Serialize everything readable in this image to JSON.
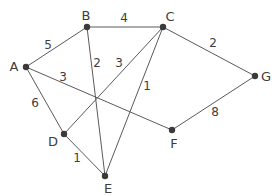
{
  "graph": {
    "type": "weighted-undirected-graph",
    "node_color": "#3a3a3a",
    "edge_color": "#5a5a5a",
    "nodes": [
      {
        "id": "A",
        "label": "A",
        "x": 26,
        "y": 67,
        "lx": 14,
        "ly": 66
      },
      {
        "id": "B",
        "label": "B",
        "x": 87,
        "y": 27,
        "lx": 86,
        "ly": 15
      },
      {
        "id": "C",
        "label": "C",
        "x": 163,
        "y": 27,
        "lx": 170,
        "ly": 16
      },
      {
        "id": "G",
        "label": "G",
        "x": 255,
        "y": 76,
        "lx": 266,
        "ly": 76
      },
      {
        "id": "F",
        "label": "F",
        "x": 172,
        "y": 130,
        "lx": 174,
        "ly": 143
      },
      {
        "id": "D",
        "label": "D",
        "x": 64,
        "y": 134,
        "lx": 53,
        "ly": 141
      },
      {
        "id": "E",
        "label": "E",
        "x": 105,
        "y": 176,
        "lx": 108,
        "ly": 188
      }
    ],
    "edges": [
      {
        "from": "A",
        "to": "B",
        "weight": "5",
        "wx": 48,
        "wy": 45
      },
      {
        "from": "B",
        "to": "C",
        "weight": "4",
        "wx": 124,
        "wy": 18
      },
      {
        "from": "C",
        "to": "G",
        "weight": "2",
        "wx": 213,
        "wy": 43
      },
      {
        "from": "A",
        "to": "D",
        "weight": "6",
        "wx": 35,
        "wy": 103
      },
      {
        "from": "A",
        "to": "F",
        "weight": "3",
        "wx": 63,
        "wy": 77
      },
      {
        "from": "B",
        "to": "E",
        "weight": "2",
        "wx": 97,
        "wy": 63
      },
      {
        "from": "C",
        "to": "D",
        "weight": "3",
        "wx": 119,
        "wy": 63
      },
      {
        "from": "C",
        "to": "E",
        "weight": "1",
        "wx": 147,
        "wy": 86
      },
      {
        "from": "D",
        "to": "E",
        "weight": "1",
        "wx": 77,
        "wy": 158
      },
      {
        "from": "F",
        "to": "G",
        "weight": "8",
        "wx": 215,
        "wy": 112
      }
    ]
  }
}
